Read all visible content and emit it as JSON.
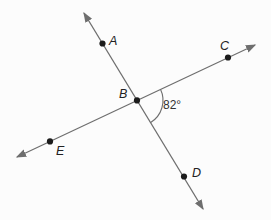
{
  "colors": {
    "background": "#fcfcfc",
    "line": "#6e6e6e",
    "point": "#1b1b1b",
    "label": "#222222"
  },
  "diagram": {
    "width": 271,
    "height": 220,
    "lines": [
      {
        "id": "line-AD",
        "through_points": "A, B, D",
        "x1": 84,
        "y1": 13,
        "x2": 203,
        "y2": 209
      },
      {
        "id": "line-EC",
        "through_points": "E, B, C",
        "x1": 17,
        "y1": 157,
        "x2": 255,
        "y2": 45
      }
    ],
    "points": [
      {
        "id": "A",
        "label": "A",
        "x": 102.5,
        "y": 43.5,
        "label_x": 109,
        "label_y": 45
      },
      {
        "id": "B",
        "label": "B",
        "x": 137,
        "y": 100.4,
        "label_x": 119,
        "label_y": 98
      },
      {
        "id": "C",
        "label": "C",
        "x": 228,
        "y": 57.5,
        "label_x": 220,
        "label_y": 50
      },
      {
        "id": "D",
        "label": "D",
        "x": 184,
        "y": 176.5,
        "label_x": 192,
        "label_y": 177
      },
      {
        "id": "E",
        "label": "E",
        "x": 50,
        "y": 141.4,
        "label_x": 56,
        "label_y": 155
      }
    ],
    "angle": {
      "label": "82°",
      "label_x": 163,
      "label_y": 109,
      "arc": {
        "cx": 137,
        "cy": 100.4,
        "r": 26,
        "start_deg": -25.2,
        "end_deg": 58.3
      }
    }
  }
}
